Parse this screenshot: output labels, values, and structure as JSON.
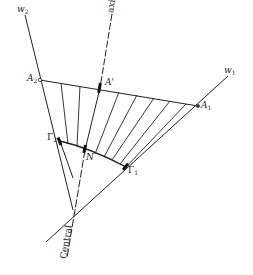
{
  "diagram": {
    "type": "geometric-construction",
    "colors": {
      "line": "#222222",
      "background": "#ffffff"
    },
    "labels": {
      "w2": "w",
      "w2_sub": "2",
      "w1": "w",
      "w1_sub": "1",
      "axis": "axis",
      "A2": "A",
      "A2_sub": "2",
      "A_prime": "A'",
      "A1": "A",
      "A1_sub": "1",
      "Gamma2": "Γ",
      "Gamma2_sub": "2",
      "N": "N",
      "Gamma1": "Γ",
      "Gamma1_sub": "1",
      "central": "Central"
    },
    "points": {
      "A2": [
        40,
        80
      ],
      "A_prime": [
        100,
        88
      ],
      "A1": [
        198,
        106
      ],
      "Gamma2": [
        60,
        141
      ],
      "N": [
        85,
        150
      ],
      "Gamma1": [
        126,
        167
      ]
    },
    "lines": {
      "w2": [
        [
          25,
          15
        ],
        [
          73,
          210
        ]
      ],
      "w1": [
        [
          46,
          242
        ],
        [
          228,
          76
        ]
      ],
      "central_axis": [
        [
          112,
          12
        ],
        [
          65,
          275
        ]
      ]
    },
    "ruling_count": 9
  }
}
